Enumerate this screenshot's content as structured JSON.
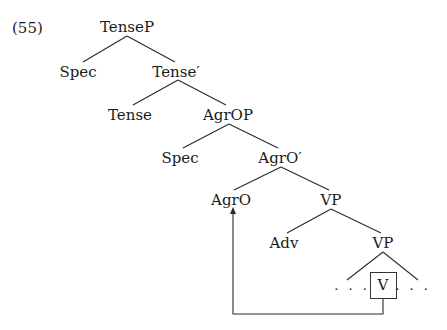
{
  "example_number": "(55)",
  "tree": {
    "nodes": [
      {
        "id": "tensep",
        "label": "TenseP",
        "x": 127,
        "y": 27
      },
      {
        "id": "spec1",
        "label": "Spec",
        "x": 78,
        "y": 72
      },
      {
        "id": "tensebar",
        "label": "Tense′",
        "x": 176,
        "y": 72
      },
      {
        "id": "tense",
        "label": "Tense",
        "x": 130,
        "y": 115
      },
      {
        "id": "agrop",
        "label": "AgrOP",
        "x": 228,
        "y": 115
      },
      {
        "id": "spec2",
        "label": "Spec",
        "x": 180,
        "y": 158
      },
      {
        "id": "agrobar",
        "label": "AgrO′",
        "x": 280,
        "y": 158
      },
      {
        "id": "agro",
        "label": "AgrO",
        "x": 231,
        "y": 200
      },
      {
        "id": "vp1",
        "label": "VP",
        "x": 331,
        "y": 200
      },
      {
        "id": "adv",
        "label": "Adv",
        "x": 284,
        "y": 243
      },
      {
        "id": "vp2",
        "label": "VP",
        "x": 383,
        "y": 243
      },
      {
        "id": "dots_left",
        "label": "· · ·",
        "x": 352,
        "y": 289
      },
      {
        "id": "v",
        "label": "V",
        "x": 383,
        "y": 285
      },
      {
        "id": "dots_right",
        "label": "· · ·",
        "x": 413,
        "y": 289
      }
    ],
    "edges": [
      [
        "tensep",
        "spec1"
      ],
      [
        "tensep",
        "tensebar"
      ],
      [
        "tensebar",
        "tense"
      ],
      [
        "tensebar",
        "agrop"
      ],
      [
        "agrop",
        "spec2"
      ],
      [
        "agrop",
        "agrobar"
      ],
      [
        "agrobar",
        "agro"
      ],
      [
        "agrobar",
        "vp1"
      ],
      [
        "vp1",
        "adv"
      ],
      [
        "vp1",
        "vp2"
      ],
      [
        "vp2",
        "dots_left"
      ],
      [
        "vp2",
        "dots_right"
      ]
    ],
    "movement": {
      "from": "v",
      "to": "agro",
      "type": "head-movement-arrow"
    }
  },
  "colors": {
    "ink": "#1a1a1a",
    "background": "#ffffff"
  }
}
